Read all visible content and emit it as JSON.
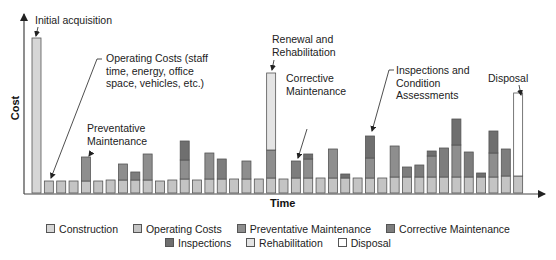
{
  "chart_data": {
    "type": "bar",
    "stacked": true,
    "title": "",
    "xlabel": "Time",
    "ylabel": "Cost",
    "grid": false,
    "ticks": false,
    "legend_position": "bottom",
    "series_order": [
      "Construction",
      "Operating Costs",
      "Preventative Maintenance",
      "Corrective Maintenance",
      "Inspections",
      "Rehabilitation",
      "Disposal"
    ],
    "colors": {
      "Construction": "#d6d6d6",
      "Operating Costs": "#c4c4c4",
      "Preventative Maintenance": "#8e8e8e",
      "Corrective Maintenance": "#7d7d7d",
      "Inspections": "#6f6f6f",
      "Rehabilitation": "#e4e4e4",
      "Disposal": "#ffffff"
    },
    "bars": [
      {
        "t": 1,
        "Construction": 155
      },
      {
        "t": 2,
        "Operating Costs": 12
      },
      {
        "t": 3,
        "Operating Costs": 12
      },
      {
        "t": 4,
        "Operating Costs": 12
      },
      {
        "t": 5,
        "Operating Costs": 12,
        "Preventative Maintenance": 24
      },
      {
        "t": 6,
        "Operating Costs": 12
      },
      {
        "t": 7,
        "Operating Costs": 13
      },
      {
        "t": 8,
        "Operating Costs": 13,
        "Preventative Maintenance": 16
      },
      {
        "t": 9,
        "Operating Costs": 13,
        "Corrective Maintenance": 8
      },
      {
        "t": 10,
        "Operating Costs": 13,
        "Preventative Maintenance": 26
      },
      {
        "t": 11,
        "Operating Costs": 12
      },
      {
        "t": 12,
        "Operating Costs": 13
      },
      {
        "t": 13,
        "Operating Costs": 14,
        "Preventative Maintenance": 19,
        "Inspections": 19
      },
      {
        "t": 14,
        "Operating Costs": 13
      },
      {
        "t": 15,
        "Operating Costs": 14,
        "Preventative Maintenance": 26
      },
      {
        "t": 16,
        "Operating Costs": 14,
        "Corrective Maintenance": 20
      },
      {
        "t": 17,
        "Operating Costs": 14
      },
      {
        "t": 18,
        "Operating Costs": 14,
        "Preventative Maintenance": 18
      },
      {
        "t": 19,
        "Operating Costs": 14
      },
      {
        "t": 20,
        "Operating Costs": 15,
        "Preventative Maintenance": 28,
        "Rehabilitation": 77
      },
      {
        "t": 21,
        "Operating Costs": 14
      },
      {
        "t": 22,
        "Operating Costs": 15,
        "Corrective Maintenance": 17
      },
      {
        "t": 23,
        "Operating Costs": 15,
        "Inspections": 5,
        "Preventative Maintenance": 19
      },
      {
        "t": 24,
        "Operating Costs": 15
      },
      {
        "t": 25,
        "Operating Costs": 15,
        "Preventative Maintenance": 29
      },
      {
        "t": 26,
        "Operating Costs": 15,
        "Inspections": 4
      },
      {
        "t": 27,
        "Operating Costs": 15
      },
      {
        "t": 28,
        "Operating Costs": 15,
        "Preventative Maintenance": 20,
        "Inspections": 22
      },
      {
        "t": 29,
        "Operating Costs": 15
      },
      {
        "t": 30,
        "Operating Costs": 16,
        "Preventative Maintenance": 31
      },
      {
        "t": 31,
        "Operating Costs": 16,
        "Corrective Maintenance": 10
      },
      {
        "t": 32,
        "Operating Costs": 16,
        "Corrective Maintenance": 12
      },
      {
        "t": 33,
        "Operating Costs": 16,
        "Inspections": 5,
        "Preventative Maintenance": 21
      },
      {
        "t": 34,
        "Operating Costs": 16,
        "Corrective Maintenance": 29
      },
      {
        "t": 35,
        "Operating Costs": 16,
        "Preventative Maintenance": 32,
        "Inspections": 26
      },
      {
        "t": 36,
        "Operating Costs": 16,
        "Corrective Maintenance": 25
      },
      {
        "t": 37,
        "Operating Costs": 16,
        "Inspections": 4
      },
      {
        "t": 38,
        "Operating Costs": 16,
        "Preventative Maintenance": 24,
        "Inspections": 22
      },
      {
        "t": 39,
        "Operating Costs": 17,
        "Corrective Maintenance": 27
      },
      {
        "t": 40,
        "Operating Costs": 17,
        "Disposal": 83
      }
    ],
    "annotations": [
      {
        "text": "Initial acquisition",
        "target_t": 1
      },
      {
        "text": "Operating Costs (staff time, energy, office space, vehicles, etc.)",
        "target_t": 2
      },
      {
        "text": "Preventative Maintenance",
        "target_t": 5
      },
      {
        "text": "Renewal and Rehabilitation",
        "target_t": 20
      },
      {
        "text": "Corrective Maintenance",
        "target_t": 22
      },
      {
        "text": "Inspections and Condition Assessments",
        "target_t": 28
      },
      {
        "text": "Disposal",
        "target_t": 40
      }
    ]
  },
  "annotations": {
    "initial": [
      "Initial acquisition"
    ],
    "operating": [
      "Operating Costs (staff",
      "time, energy, office",
      "space, vehicles, etc.)"
    ],
    "preventative": [
      "Preventative",
      "Maintenance"
    ],
    "renewal": [
      "Renewal and",
      "Rehabilitation"
    ],
    "corrective": [
      "Corrective",
      "Maintenance"
    ],
    "inspections": [
      "Inspections and",
      "Condition",
      "Assessments"
    ],
    "disposal": [
      "Disposal"
    ]
  },
  "axes": {
    "x_label": "Time",
    "y_label": "Cost"
  },
  "legend": {
    "row1": [
      {
        "label": "Construction",
        "color": "#d6d6d6"
      },
      {
        "label": "Operating Costs",
        "color": "#c4c4c4"
      },
      {
        "label": "Preventative Maintenance",
        "color": "#8e8e8e"
      },
      {
        "label": "Corrective Maintenance",
        "color": "#7d7d7d"
      }
    ],
    "row2": [
      {
        "label": "Inspections",
        "color": "#6f6f6f"
      },
      {
        "label": "Rehabilitation",
        "color": "#e4e4e4"
      },
      {
        "label": "Disposal",
        "color": "#ffffff"
      }
    ]
  }
}
